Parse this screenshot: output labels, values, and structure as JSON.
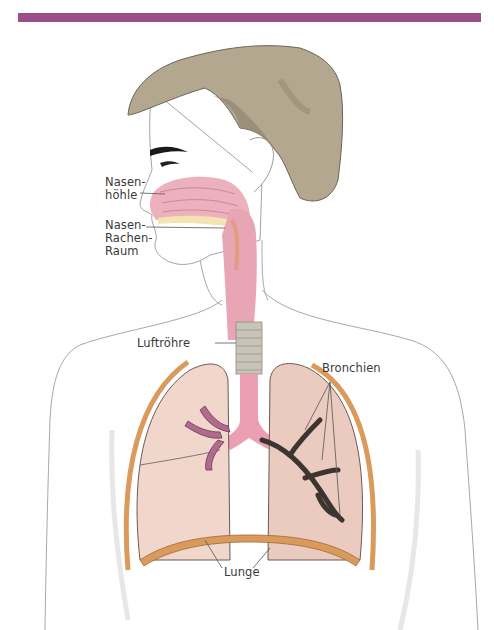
{
  "colors": {
    "top_bar": "#9a4f8a",
    "hair": "#b3a790",
    "hair_shadow": "#958a73",
    "skin_outline": "#9a9a9a",
    "airway_pink": "#e8a5b4",
    "lung_fill": "#f1d6cc",
    "lung_fill_dark": "#e7c4b9",
    "pleura_orange": "#d99a5c",
    "bronchi_purple": "#b06a8e",
    "bronchi_dark": "#4e4440",
    "trachea_gray": "#c8c5b8",
    "palate_yellow": "#f4e3b3",
    "label_text": "#3a3a3a",
    "leader_line": "#555555"
  },
  "labels": {
    "nasenhoehle": [
      "Nasen-",
      "höhle"
    ],
    "nasen_rachen_raum": [
      "Nasen-",
      "Rachen-",
      "Raum"
    ],
    "luftroehre": "Luftröhre",
    "bronchien": "Bronchien",
    "lunge": "Lunge"
  }
}
